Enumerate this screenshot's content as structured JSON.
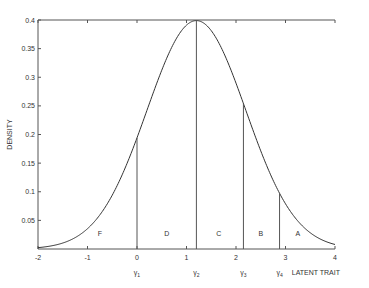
{
  "chart_data": {
    "type": "line",
    "title": "",
    "xlabel": "LATENT TRAIT",
    "ylabel": "DENSITY",
    "xlim": [
      -2,
      4
    ],
    "ylim": [
      0,
      0.4
    ],
    "x_ticks": [
      "-2",
      "-1",
      "0",
      "1",
      "2",
      "3",
      "4"
    ],
    "y_ticks": [
      "0.05",
      "0.1",
      "0.15",
      "0.2",
      "0.25",
      "0.3",
      "0.35",
      "0.4"
    ],
    "grid": false,
    "series": [
      {
        "name": "normal density",
        "mean": 1.2,
        "sd": 1.0,
        "x": [
          -2,
          -1.5,
          -1,
          -0.5,
          0,
          0.5,
          1,
          1.2,
          1.5,
          2,
          2.5,
          3,
          3.5,
          4
        ],
        "values": [
          0.002,
          0.01,
          0.036,
          0.095,
          0.194,
          0.312,
          0.391,
          0.399,
          0.381,
          0.29,
          0.171,
          0.079,
          0.028,
          0.008
        ]
      }
    ],
    "cutpoints": [
      {
        "label": "γ1",
        "sub": "1",
        "x": 0.0
      },
      {
        "label": "γ2",
        "sub": "2",
        "x": 1.2
      },
      {
        "label": "γ3",
        "sub": "3",
        "x": 2.15
      },
      {
        "label": "γ4",
        "sub": "4",
        "x": 2.88
      }
    ],
    "regions": [
      {
        "label": "F",
        "x": -0.75
      },
      {
        "label": "D",
        "x": 0.6
      },
      {
        "label": "C",
        "x": 1.65
      },
      {
        "label": "B",
        "x": 2.5
      },
      {
        "label": "A",
        "x": 3.25
      }
    ]
  }
}
